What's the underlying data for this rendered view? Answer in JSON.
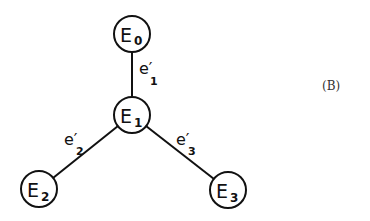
{
  "figure_label": "(B)",
  "nodes": [
    {
      "id": "E0",
      "base": "E",
      "sub": "0",
      "cx": 132,
      "cy": 34
    },
    {
      "id": "E1",
      "base": "E",
      "sub": "1",
      "cx": 132,
      "cy": 115
    },
    {
      "id": "E2",
      "base": "E",
      "sub": "2",
      "cx": 39,
      "cy": 189
    },
    {
      "id": "E3",
      "base": "E",
      "sub": "3",
      "cx": 228,
      "cy": 190
    }
  ],
  "edges": [
    {
      "from": "E0",
      "to": "E1",
      "base": "e′",
      "sub": "1"
    },
    {
      "from": "E1",
      "to": "E2",
      "base": "e′",
      "sub": "2"
    },
    {
      "from": "E1",
      "to": "E3",
      "base": "e′",
      "sub": "3"
    }
  ],
  "style": {
    "stroke": "#111111",
    "background": "#ffffff",
    "node_radius": 18
  }
}
